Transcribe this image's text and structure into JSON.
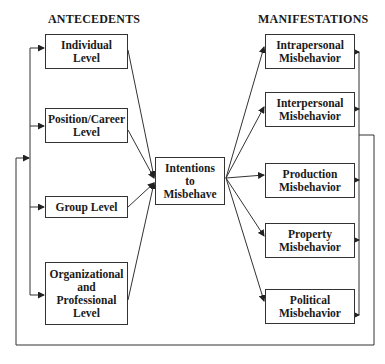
{
  "headings": {
    "left": "ANTECEDENTS",
    "right": "MANIFESTATIONS"
  },
  "antecedents": [
    {
      "label": "Individual\nLevel"
    },
    {
      "label": "Position/Career\nLevel"
    },
    {
      "label": "Group Level"
    },
    {
      "label": "Organizational\nand\nProfessional\nLevel"
    }
  ],
  "center": {
    "label": "Intentions\nto\nMisbehave"
  },
  "manifestations": [
    {
      "label": "Intrapersonal\nMisbehavior"
    },
    {
      "label": "Interpersonal\nMisbehavior"
    },
    {
      "label": "Production\nMisbehavior"
    },
    {
      "label": "Property\nMisbehavior"
    },
    {
      "label": "Political\nMisbehavior"
    }
  ],
  "colors": {
    "line": "#333333",
    "background": "#ffffff"
  }
}
